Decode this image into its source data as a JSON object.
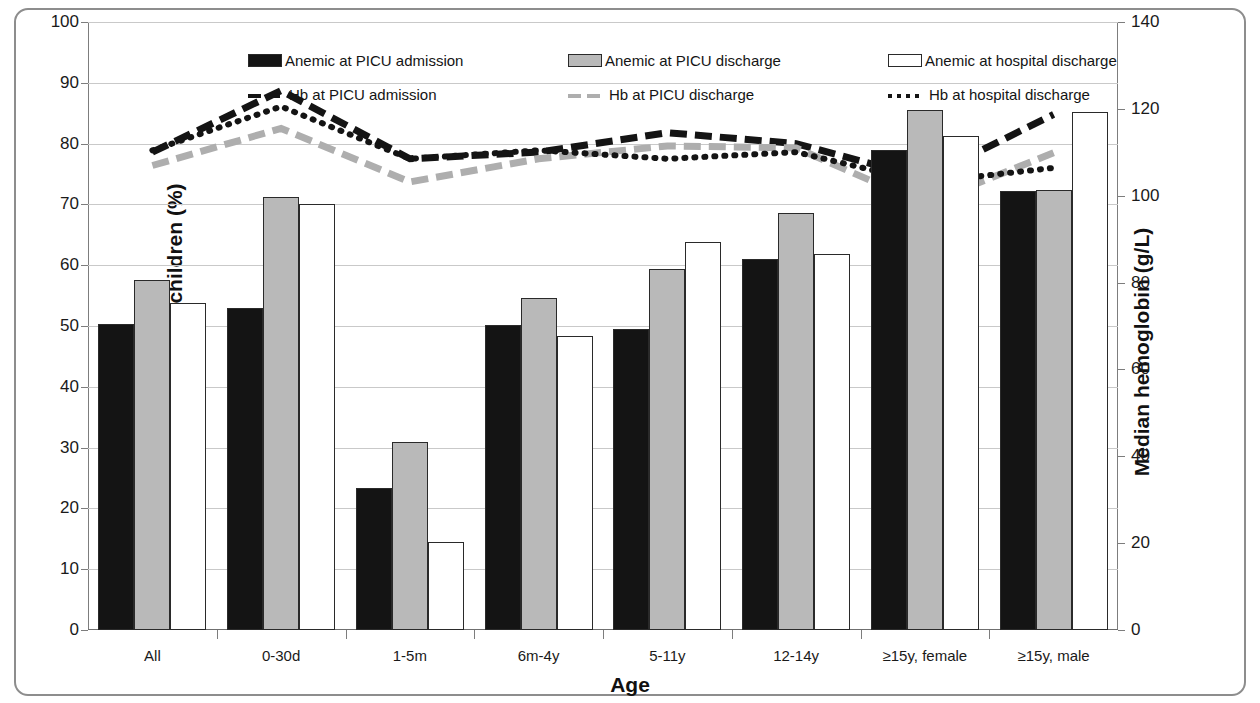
{
  "chart_data": {
    "type": "bar",
    "title": "",
    "xlabel": "Age",
    "ylabel": "Proportion of anemic children (%)",
    "ylabel_secondary": "Median hemoglobin (g/L)",
    "ylim": [
      0,
      100
    ],
    "ylim_secondary": [
      0,
      140
    ],
    "ytick_step": 10,
    "ytick_step_secondary": 20,
    "grid": true,
    "legend_position": "top-inside",
    "categories": [
      "All",
      "0-30d",
      "1-5m",
      "6m-4y",
      "5-11y",
      "12-14y",
      "≥15y, female",
      "≥15y, male"
    ],
    "yticks": [
      "0",
      "10",
      "20",
      "30",
      "40",
      "50",
      "60",
      "70",
      "80",
      "90",
      "100"
    ],
    "yticks_secondary": [
      "0",
      "20",
      "40",
      "60",
      "80",
      "100",
      "120",
      "140"
    ],
    "series": [
      {
        "name": "Anemic at PICU admission",
        "kind": "bar",
        "fill": "black",
        "axis": "left",
        "unit": "%",
        "values": [
          50.3,
          53.0,
          23.3,
          50.2,
          49.5,
          61.0,
          79.0,
          72.2
        ]
      },
      {
        "name": "Anemic at PICU discharge",
        "kind": "bar",
        "fill": "gray",
        "axis": "left",
        "unit": "%",
        "values": [
          57.6,
          71.2,
          31.0,
          54.6,
          59.4,
          68.6,
          85.5,
          72.3
        ]
      },
      {
        "name": "Anemic at hospital discharge",
        "kind": "bar",
        "fill": "white",
        "axis": "left",
        "unit": "%",
        "values": [
          53.8,
          70.0,
          14.5,
          48.3,
          63.8,
          61.8,
          81.3,
          85.2
        ]
      },
      {
        "name": "Hb at PICU admission",
        "kind": "line",
        "style": "dashed",
        "color": "black",
        "axis": "right",
        "unit": "g/L",
        "values_right_axis": [
          110,
          124,
          108.5,
          110,
          114.5,
          112,
          104,
          119
        ],
        "values_left_scale": [
          78.6,
          88.7,
          77.5,
          78.6,
          81.8,
          80.0,
          74.3,
          84.8
        ]
      },
      {
        "name": "Hb at PICU discharge",
        "kind": "line",
        "style": "dashed",
        "color": "gray",
        "axis": "right",
        "unit": "g/L",
        "values_right_axis": [
          107,
          115.5,
          103,
          108.5,
          111.5,
          111,
          98,
          110
        ],
        "values_left_scale": [
          76.4,
          82.5,
          73.7,
          77.5,
          79.6,
          79.3,
          70.0,
          78.5
        ]
      },
      {
        "name": "Hb at hospital discharge",
        "kind": "line",
        "style": "dotted",
        "color": "black",
        "axis": "right",
        "unit": "g/L",
        "values_right_axis": [
          110.5,
          120.5,
          108.5,
          110.5,
          108.5,
          110,
          103,
          106.5
        ],
        "values_left_scale": [
          78.9,
          86.1,
          77.5,
          78.9,
          77.5,
          78.6,
          73.6,
          76.0
        ]
      }
    ],
    "legend": [
      {
        "label": "Anemic at PICU admission",
        "marker": "swatch-black"
      },
      {
        "label": "Anemic at PICU discharge",
        "marker": "swatch-gray"
      },
      {
        "label": "Anemic at hospital discharge",
        "marker": "swatch-white"
      },
      {
        "label": "Hb at PICU admission",
        "marker": "dash-black"
      },
      {
        "label": "Hb at PICU discharge",
        "marker": "dash-gray"
      },
      {
        "label": "Hb at hospital discharge",
        "marker": "dot-black"
      }
    ],
    "colors": {
      "bar_black": "#141414",
      "bar_gray": "#b9b9b9",
      "bar_white": "#ffffff",
      "line_black": "#141414",
      "line_gray": "#aeaeae",
      "grid": "#c9c9c9",
      "frame": "#8d8d8d"
    }
  }
}
